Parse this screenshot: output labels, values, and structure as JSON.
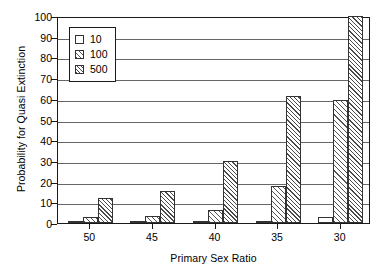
{
  "chart_data": {
    "type": "bar",
    "title": "",
    "xlabel": "Primary Sex Ratio",
    "ylabel": "Probability for Quasi Extinction",
    "categories": [
      "50",
      "45",
      "40",
      "35",
      "30"
    ],
    "series": [
      {
        "name": "10",
        "values": [
          0.5,
          0.5,
          0.5,
          1,
          3
        ]
      },
      {
        "name": "100",
        "values": [
          3,
          3.5,
          6.5,
          18,
          59.5
        ]
      },
      {
        "name": "500",
        "values": [
          12,
          15.5,
          30,
          61.5,
          100
        ]
      }
    ],
    "ylim": [
      0,
      100
    ],
    "yticks": [
      0,
      10,
      20,
      30,
      40,
      50,
      60,
      70,
      80,
      90,
      100
    ],
    "ytick_labels": [
      "0",
      "10",
      "20",
      "30",
      "40",
      "50",
      "60",
      "70",
      "80",
      "90",
      "100"
    ],
    "grid": true,
    "grid_axis": "y",
    "legend_position": "upper-left-inside",
    "legend_entries": [
      "10",
      "100",
      "500"
    ],
    "series_fills": [
      "solid-white",
      "diagonal-hatch-light",
      "diagonal-hatch-dense"
    ],
    "colors": {
      "axis": "#1a1a1a",
      "grid": "#666666",
      "bar_edge": "#333333",
      "bar_fill": "#ffffff",
      "hatch": "#4a4a4a",
      "background": "#ffffff",
      "text": "#000000"
    }
  }
}
